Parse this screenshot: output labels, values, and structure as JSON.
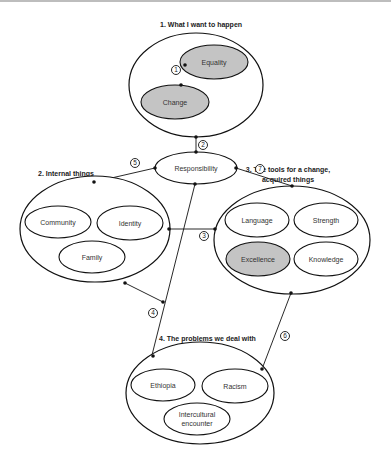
{
  "diagram": {
    "groups": [
      {
        "id": "g1",
        "title": "1. What I want to happen",
        "items": [
          "Equality",
          "Change"
        ],
        "highlighted": [
          "Equality",
          "Change"
        ]
      },
      {
        "id": "g2",
        "title": "2. Internal things",
        "items": [
          "Community",
          "Identity",
          "Family"
        ],
        "highlighted": []
      },
      {
        "id": "g3",
        "title_line1": "3. The tools for a change,",
        "title_line2": "acquired things",
        "items": [
          "Language",
          "Strength",
          "Excellence",
          "Knowledge"
        ],
        "highlighted": [
          "Excellence"
        ]
      },
      {
        "id": "g4",
        "title": "4. The problems we deal with",
        "items": [
          "Ethiopia",
          "Racism",
          "Intercultural",
          "encounter"
        ],
        "highlighted": []
      }
    ],
    "hub": {
      "label": "Responsibility"
    },
    "connectors": [
      {
        "num": "1",
        "from": "Change",
        "to": "Equality"
      },
      {
        "num": "2",
        "from": "Group 1",
        "to": "Responsibility"
      },
      {
        "num": "3",
        "from": "Group 2",
        "to": "Group 3"
      },
      {
        "num": "4",
        "from": "Group 2",
        "to": "Group 4"
      },
      {
        "num": "5",
        "from": "Responsibility",
        "to": "Group 2"
      },
      {
        "num": "6",
        "from": "Group 3",
        "to": "Group 4"
      },
      {
        "num": "7",
        "from": "Responsibility",
        "to": "Group 3"
      }
    ]
  }
}
